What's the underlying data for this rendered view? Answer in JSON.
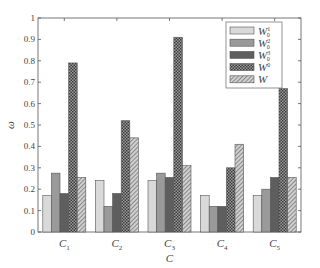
{
  "chart_data": {
    "type": "bar",
    "title": "",
    "xlabel": "C",
    "ylabel": "ω",
    "ylim": [
      0,
      1
    ],
    "yticks": [
      0,
      0.1,
      0.2,
      0.3,
      0.4,
      0.5,
      0.6,
      0.7,
      0.8,
      0.9,
      1
    ],
    "grid": false,
    "legend_position": "upper right",
    "categories": [
      "C1",
      "C2",
      "C3",
      "C4",
      "C5"
    ],
    "series": [
      {
        "name": "W^1_0",
        "fill": "#d9d9d9",
        "pattern": "solid",
        "values": [
          0.17,
          0.24,
          0.24,
          0.17,
          0.17
        ]
      },
      {
        "name": "W^2_0",
        "fill": "#9a9a9a",
        "pattern": "solid",
        "values": [
          0.275,
          0.12,
          0.275,
          0.12,
          0.2
        ]
      },
      {
        "name": "W^3_0",
        "fill": "#5e5e5e",
        "pattern": "solid",
        "values": [
          0.18,
          0.18,
          0.255,
          0.12,
          0.255
        ]
      },
      {
        "name": "W^0",
        "fill": "#555555",
        "pattern": "checker",
        "values": [
          0.79,
          0.52,
          0.91,
          0.3,
          0.67
        ]
      },
      {
        "name": "W",
        "fill": "#bbbbbb",
        "pattern": "hatch",
        "values": [
          0.255,
          0.44,
          0.31,
          0.41,
          0.255
        ]
      }
    ]
  }
}
